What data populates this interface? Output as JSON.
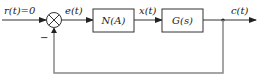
{
  "diagram": {
    "type": "feedback-control-block-diagram",
    "input": {
      "label": "r(t)=0"
    },
    "summing_junction": {
      "feedback_sign": "−"
    },
    "signals": {
      "error": "e(t)",
      "intermediate": "x(t)",
      "output": "c(t)"
    },
    "blocks": [
      {
        "id": "nonlinear",
        "label": "N(A)"
      },
      {
        "id": "plant",
        "label": "G(s)"
      }
    ],
    "feedback": {
      "type": "unity",
      "sign": "negative"
    }
  }
}
